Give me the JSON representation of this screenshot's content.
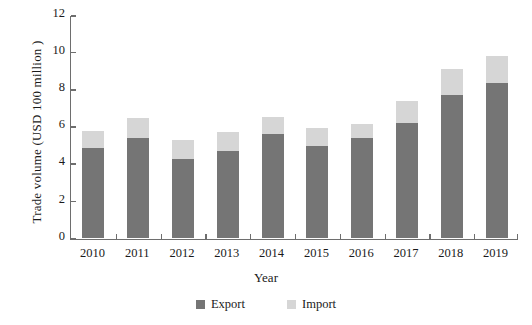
{
  "chart_data": {
    "type": "bar",
    "subtype": "stacked",
    "title": "",
    "xlabel": "Year",
    "ylabel": "Trade volume (USD 100 million )",
    "categories": [
      "2010",
      "2011",
      "2012",
      "2013",
      "2014",
      "2015",
      "2016",
      "2017",
      "2018",
      "2019"
    ],
    "series": [
      {
        "name": "Export",
        "color": "#757575",
        "values": [
          4.85,
          5.4,
          4.25,
          4.65,
          5.6,
          4.95,
          5.35,
          6.2,
          7.7,
          8.35
        ]
      },
      {
        "name": "Import",
        "color": "#d6d6d6",
        "values": [
          0.9,
          1.05,
          1.0,
          1.05,
          0.9,
          0.95,
          0.8,
          1.15,
          1.4,
          1.45
        ]
      }
    ],
    "totals": [
      5.75,
      6.45,
      5.25,
      5.7,
      6.5,
      5.9,
      6.15,
      7.35,
      9.1,
      9.8
    ],
    "ylim": [
      0,
      12
    ],
    "yticks": [
      0,
      2,
      4,
      6,
      8,
      10,
      12
    ],
    "ytick_labels": [
      "0",
      "2",
      "4",
      "6",
      "8",
      "10",
      "12"
    ],
    "grid": false,
    "legend_position": "bottom-center",
    "legend": [
      {
        "label": "Export",
        "color": "#757575"
      },
      {
        "label": "Import",
        "color": "#d6d6d6"
      }
    ],
    "axis_color": "#6e6e6e"
  }
}
